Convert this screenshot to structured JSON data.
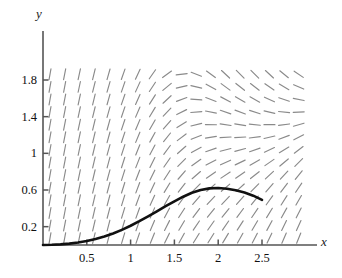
{
  "chart_data": {
    "type": "line",
    "title": "",
    "subtitle": "",
    "xlabel": "x",
    "ylabel": "y",
    "xlim": [
      0,
      2.95
    ],
    "ylim": [
      0,
      2.02
    ],
    "grid": false,
    "legend": null,
    "annotations": [],
    "x_ticks": [
      {
        "value": 0.5,
        "label": "0.5"
      },
      {
        "value": 1,
        "label": "1"
      },
      {
        "value": 1.5,
        "label": "1.5"
      },
      {
        "value": 2,
        "label": "2"
      },
      {
        "value": 2.5,
        "label": "2.5"
      }
    ],
    "y_ticks": [
      {
        "value": 0.2,
        "label": "0.2"
      },
      {
        "value": 0.6,
        "label": "0.6"
      },
      {
        "value": 1,
        "label": "1"
      },
      {
        "value": 1.4,
        "label": "1.4"
      },
      {
        "value": 1.8,
        "label": "1.8"
      }
    ],
    "series": [
      {
        "name": "solution-curve",
        "type": "line",
        "color": "#111111",
        "width": 2.6,
        "x": [
          0.0,
          0.1,
          0.2,
          0.3,
          0.4,
          0.5,
          0.6,
          0.7,
          0.8,
          0.9,
          1.0,
          1.1,
          1.2,
          1.3,
          1.4,
          1.5,
          1.6,
          1.7,
          1.8,
          1.9,
          2.0,
          2.1,
          2.2,
          2.3,
          2.4,
          2.5
        ],
        "y": [
          0.0,
          0.002,
          0.007,
          0.015,
          0.027,
          0.043,
          0.065,
          0.092,
          0.125,
          0.165,
          0.21,
          0.26,
          0.313,
          0.367,
          0.423,
          0.477,
          0.527,
          0.57,
          0.6,
          0.618,
          0.622,
          0.614,
          0.597,
          0.572,
          0.538,
          0.492
        ]
      }
    ],
    "direction_field": {
      "name": "slope-field",
      "color": "#8a8a8a",
      "stroke_width": 1.15,
      "segment_length": 11,
      "x_start": 0.08,
      "x_step": 0.167,
      "x_count": 18,
      "y_start": 0.075,
      "y_step": 0.1375,
      "y_count": 14,
      "slope_formula": "dy/dx = x*(y-1)*(y-0.5)... rendered as saddle pattern near (2,1)",
      "saddle_x": 2.0,
      "saddle_y": 1.05
    }
  },
  "labels": {
    "x_axis": "x",
    "y_axis": "y"
  }
}
